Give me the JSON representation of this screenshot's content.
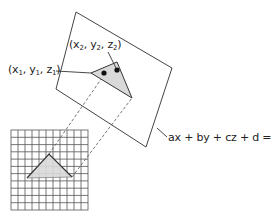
{
  "diagram": {
    "type": "plane-projection",
    "labels": {
      "point1": {
        "x": "x",
        "y": "y",
        "z": "z",
        "sub": "1"
      },
      "point2": {
        "x": "x",
        "y": "y",
        "z": "z",
        "sub": "2"
      },
      "plane_equation": "ax + by + cz + d = 0"
    },
    "colors": {
      "line": "#444444",
      "fill": "#d9d9d9",
      "dot": "#111111",
      "grid": "#555555"
    },
    "grid": {
      "columns": 11,
      "rows": 11
    }
  }
}
